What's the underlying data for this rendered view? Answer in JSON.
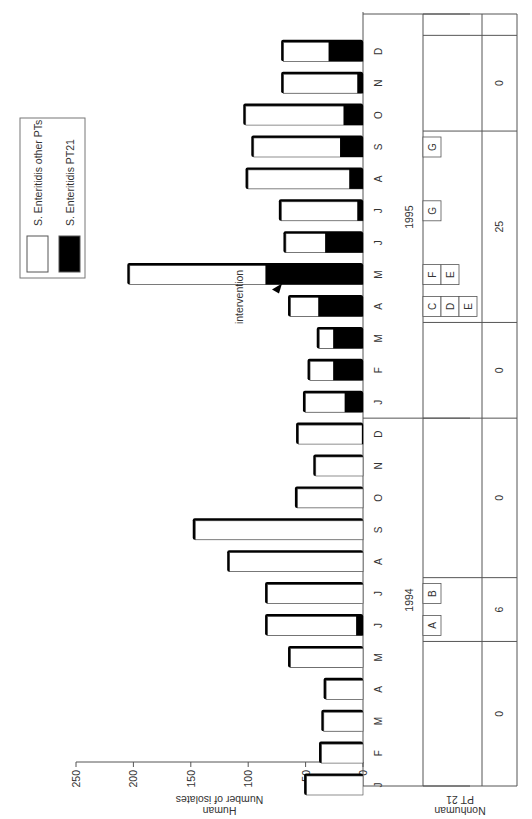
{
  "chart_data": {
    "type": "bar",
    "orientation": "rotated 90deg clockwise (months run bottom-to-top, bars extend leftward)",
    "stacked": true,
    "title": "",
    "ylabel": "Number of isolates Human",
    "ylabel_lines": [
      "Number of isolates",
      "Human"
    ],
    "xlabel": "",
    "ylim": [
      0,
      250
    ],
    "yticks": [
      0,
      50,
      100,
      150,
      200,
      250
    ],
    "grid": false,
    "legend_position": "top-right (upper-left in rotated view)",
    "years": [
      {
        "label": "1994",
        "start_index": 0,
        "end_index": 11
      },
      {
        "label": "1995",
        "start_index": 12,
        "end_index": 23
      }
    ],
    "categories": [
      "J",
      "F",
      "M",
      "A",
      "M",
      "J",
      "J",
      "A",
      "S",
      "O",
      "N",
      "D",
      "J",
      "F",
      "M",
      "A",
      "M",
      "J",
      "J",
      "A",
      "S",
      "O",
      "N",
      "D"
    ],
    "series": [
      {
        "name": "S. Enteritidis PT21",
        "color": "#000000",
        "values": [
          0,
          0,
          0,
          0,
          0,
          6,
          0,
          0,
          0,
          0,
          0,
          1,
          16,
          26,
          26,
          39,
          85,
          33,
          5,
          12,
          20,
          17,
          5,
          30
        ]
      },
      {
        "name": "S. Enteritidis other PTs",
        "color": "#ffffff",
        "values": [
          50,
          37,
          35,
          33,
          64,
          78,
          84,
          117,
          147,
          58,
          42,
          56,
          35,
          21,
          13,
          25,
          119,
          35,
          67,
          89,
          76,
          86,
          65,
          40
        ]
      }
    ],
    "totals": [
      50,
      37,
      35,
      33,
      64,
      84,
      84,
      117,
      147,
      58,
      42,
      57,
      51,
      47,
      39,
      64,
      204,
      68,
      72,
      101,
      96,
      103,
      70,
      70
    ],
    "annotations": [
      {
        "text": "intervention",
        "at_index": 16,
        "marker": "arrowhead"
      }
    ],
    "nonhuman_table": {
      "label_lines": [
        "Nonhuman",
        "PT 21"
      ],
      "letter_boxes": [
        {
          "letter": "A",
          "index": 5,
          "row": 0
        },
        {
          "letter": "B",
          "index": 6,
          "row": 0
        },
        {
          "letter": "C",
          "index": 15,
          "row": 0
        },
        {
          "letter": "D",
          "index": 15,
          "row": 1
        },
        {
          "letter": "E",
          "index": 15,
          "row": 2
        },
        {
          "letter": "F",
          "index": 16,
          "row": 0
        },
        {
          "letter": "E",
          "index": 16,
          "row": 1
        },
        {
          "letter": "G",
          "index": 18,
          "row": 0
        },
        {
          "letter": "G",
          "index": 20,
          "row": 0
        }
      ],
      "counts": [
        {
          "from_index": 0,
          "to_index": 4,
          "value": "0"
        },
        {
          "from_index": 5,
          "to_index": 6,
          "value": "6"
        },
        {
          "from_index": 7,
          "to_index": 11,
          "value": "0"
        },
        {
          "from_index": 12,
          "to_index": 14,
          "value": "0"
        },
        {
          "from_index": 15,
          "to_index": 20,
          "value": "25"
        },
        {
          "from_index": 21,
          "to_index": 23,
          "value": "0"
        }
      ]
    }
  },
  "legend": {
    "items": [
      {
        "label": "S. Enteritidis other PTs",
        "color": "#ffffff"
      },
      {
        "label": "S. Enteritidis PT21",
        "color": "#000000"
      }
    ]
  },
  "axis": {
    "ylabel_line1": "Number of isolates",
    "ylabel_line2": "Human",
    "nonhuman_line1": "Nonhuman",
    "nonhuman_line2": "PT 21"
  },
  "colors": {
    "axis": "#555555",
    "bar_outline": "#000000",
    "pt21": "#000000",
    "other": "#ffffff"
  }
}
